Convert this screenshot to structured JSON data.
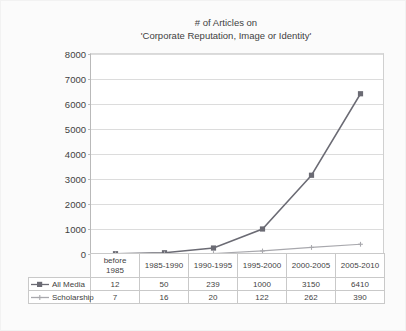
{
  "chart_data": {
    "type": "line",
    "title": "# of Articles on 'Corporate Reputation, Image or Identity'",
    "title_lines": [
      "# of Articles on",
      "'Corporate Reputation, Image or Identity'"
    ],
    "xlabel": "",
    "ylabel": "",
    "ylim": [
      0,
      8000
    ],
    "ytick_labels": [
      "8000",
      "7000",
      "6000",
      "5000",
      "4000",
      "3000",
      "2000",
      "1000",
      "0"
    ],
    "ytick_values": [
      8000,
      7000,
      6000,
      5000,
      4000,
      3000,
      2000,
      1000,
      0
    ],
    "grid": true,
    "legend_position": "table-left",
    "categories": [
      "before 1985",
      "1985-1990",
      "1990-1995",
      "1995-2000",
      "2000-2005",
      "2005-2010"
    ],
    "category_lines": [
      [
        "before",
        "1985"
      ],
      [
        "1985-1990"
      ],
      [
        "1990-1995"
      ],
      [
        "1995-2000"
      ],
      [
        "2000-2005"
      ],
      [
        "2005-2010"
      ]
    ],
    "series": [
      {
        "name": "All Media",
        "values": [
          12,
          50,
          239,
          1000,
          3150,
          6410
        ],
        "color": "#6b6b74",
        "marker": "square"
      },
      {
        "name": "Scholarship",
        "values": [
          7,
          16,
          20,
          122,
          262,
          390
        ],
        "color": "#a8a8ad",
        "marker": "plus"
      }
    ]
  },
  "colors": {
    "all_media": "#6b6b74",
    "scholarship": "#a8a8ad",
    "grid": "#dcdcdc",
    "axis": "#b9b9b9",
    "text": "#3f3f3f",
    "table_border": "#c9c9c9",
    "background": "#ffffff"
  },
  "table": {
    "header_blank": "",
    "rows": [
      {
        "label": "All Media",
        "values": [
          "12",
          "50",
          "239",
          "1000",
          "3150",
          "6410"
        ]
      },
      {
        "label": "Scholarship",
        "values": [
          "7",
          "16",
          "20",
          "122",
          "262",
          "390"
        ]
      }
    ]
  }
}
